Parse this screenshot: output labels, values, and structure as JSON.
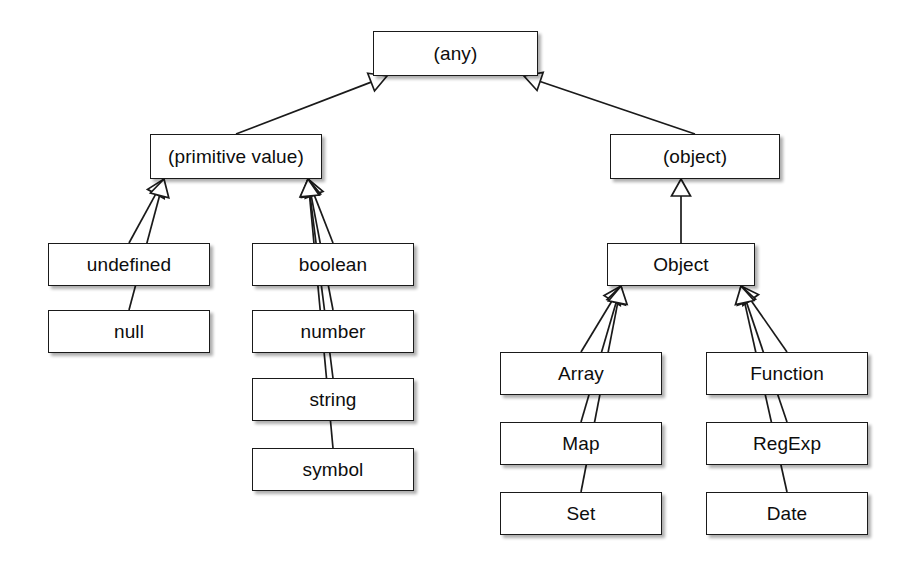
{
  "diagram": {
    "type": "uml-class-generalization",
    "style": {
      "box_fill": "#ffffff",
      "box_stroke": "#1a1a1a",
      "edge_stroke": "#1a1a1a",
      "text_color": "#0d0d0d",
      "background": "#ffffff",
      "arrowhead": "hollow-triangle-generalization"
    },
    "nodes": [
      {
        "id": "any",
        "label": "(any)",
        "x": 373,
        "y": 31,
        "w": 165,
        "h": 45
      },
      {
        "id": "primitive",
        "label": "(primitive value)",
        "x": 150,
        "y": 134,
        "w": 172,
        "h": 45
      },
      {
        "id": "object",
        "label": "(object)",
        "x": 610,
        "y": 134,
        "w": 170,
        "h": 45
      },
      {
        "id": "undefined",
        "label": "undefined",
        "x": 48,
        "y": 243,
        "w": 162,
        "h": 43
      },
      {
        "id": "null",
        "label": "null",
        "x": 48,
        "y": 310,
        "w": 162,
        "h": 43
      },
      {
        "id": "boolean",
        "label": "boolean",
        "x": 252,
        "y": 243,
        "w": 162,
        "h": 43
      },
      {
        "id": "number",
        "label": "number",
        "x": 252,
        "y": 310,
        "w": 162,
        "h": 43
      },
      {
        "id": "string",
        "label": "string",
        "x": 252,
        "y": 378,
        "w": 162,
        "h": 43
      },
      {
        "id": "symbol",
        "label": "symbol",
        "x": 252,
        "y": 448,
        "w": 162,
        "h": 43
      },
      {
        "id": "Object",
        "label": "Object",
        "x": 607,
        "y": 243,
        "w": 148,
        "h": 43
      },
      {
        "id": "Array",
        "label": "Array",
        "x": 500,
        "y": 352,
        "w": 162,
        "h": 43
      },
      {
        "id": "Function",
        "label": "Function",
        "x": 706,
        "y": 352,
        "w": 162,
        "h": 43
      },
      {
        "id": "Map",
        "label": "Map",
        "x": 500,
        "y": 422,
        "w": 162,
        "h": 43
      },
      {
        "id": "RegExp",
        "label": "RegExp",
        "x": 706,
        "y": 422,
        "w": 162,
        "h": 43
      },
      {
        "id": "Set",
        "label": "Set",
        "x": 500,
        "y": 492,
        "w": 162,
        "h": 43
      },
      {
        "id": "Date",
        "label": "Date",
        "x": 706,
        "y": 492,
        "w": 162,
        "h": 43
      }
    ],
    "edges": [
      {
        "from": "primitive",
        "to": "any",
        "kind": "generalization"
      },
      {
        "from": "object",
        "to": "any",
        "kind": "generalization"
      },
      {
        "from": "undefined",
        "to": "primitive",
        "kind": "generalization"
      },
      {
        "from": "null",
        "to": "primitive",
        "kind": "generalization"
      },
      {
        "from": "boolean",
        "to": "primitive",
        "kind": "generalization"
      },
      {
        "from": "number",
        "to": "primitive",
        "kind": "generalization"
      },
      {
        "from": "string",
        "to": "primitive",
        "kind": "generalization"
      },
      {
        "from": "symbol",
        "to": "primitive",
        "kind": "generalization"
      },
      {
        "from": "Object",
        "to": "object",
        "kind": "generalization"
      },
      {
        "from": "Array",
        "to": "Object",
        "kind": "generalization"
      },
      {
        "from": "Function",
        "to": "Object",
        "kind": "generalization"
      },
      {
        "from": "Map",
        "to": "Object",
        "kind": "generalization"
      },
      {
        "from": "RegExp",
        "to": "Object",
        "kind": "generalization"
      },
      {
        "from": "Set",
        "to": "Object",
        "kind": "generalization"
      },
      {
        "from": "Date",
        "to": "Object",
        "kind": "generalization"
      }
    ]
  }
}
